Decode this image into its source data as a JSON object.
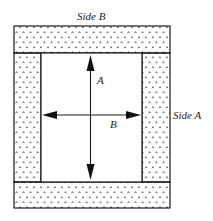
{
  "diagram": {
    "labels": {
      "side_b": "Side B",
      "side_a": "Side A",
      "arrow_a": "A",
      "arrow_b": "B"
    },
    "colors": {
      "stroke": "#1a1a1a",
      "hatch": "#333333",
      "background": "#ffffff"
    },
    "pattern": "caret-dot-hatch"
  }
}
